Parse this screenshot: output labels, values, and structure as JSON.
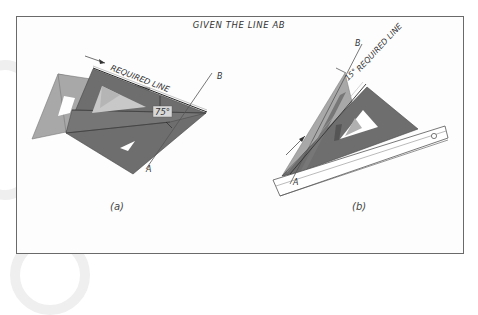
{
  "title": "GIVEN THE LINE AB",
  "figure_a": {
    "caption": "(a)",
    "required_line_label": "REQUIRED LINE",
    "angle_label": "75°",
    "point_a": "A",
    "point_b": "B"
  },
  "figure_b": {
    "caption": "(b)",
    "required_line_label": "REQUIRED LINE",
    "angle_label": "15°",
    "point_a": "A",
    "point_b": "B"
  },
  "colors": {
    "triangle_dark": "#6e6e6e",
    "triangle_light": "#a8a8a8",
    "frame": "#6a6a6a",
    "background": "#ffffff"
  }
}
